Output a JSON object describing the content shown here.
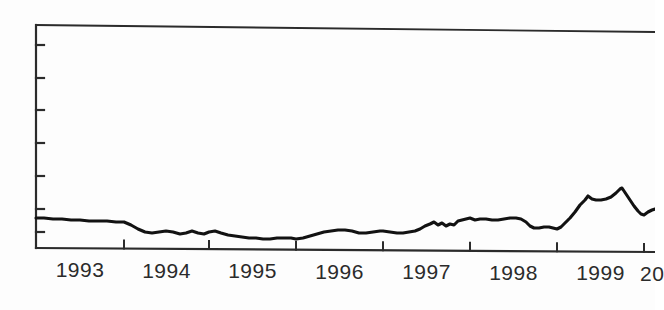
{
  "figure": {
    "kind": "scanned-line-chart",
    "background_color": "#fdfdfd",
    "ink_color": "#1f1f1f",
    "axis_color": "#2b2b2b",
    "line_color": "#121212"
  },
  "axes": {
    "x_axis_name": "year-axis",
    "y_axis_name": "value-axis",
    "y_axis_labels_visible": false,
    "x_axis_baseline_y": 248,
    "frame_left_x": 36,
    "frame_top_y_left": 25,
    "frame_top_y_right": 32,
    "y_tick_count": 7,
    "y_tick_positions_px": [
      45,
      78,
      110,
      143,
      176,
      209,
      232
    ],
    "x_tick_positions_px": [
      36,
      124,
      209,
      296,
      383,
      470,
      557,
      644
    ]
  },
  "chart_data": {
    "type": "line",
    "title": "",
    "subtitle": "",
    "xlabel": "",
    "ylabel": "",
    "grid": false,
    "legend": null,
    "annotations": [],
    "x_tick_labels": [
      "1993",
      "1994",
      "1995",
      "1996",
      "1997",
      "1998",
      "1999",
      "20"
    ],
    "x_tick_label_note": "final label clipped at right edge of image",
    "y_tick_labels": [],
    "xlim": [
      "1992.5",
      "2000.1"
    ],
    "series": [
      {
        "name": "series-1",
        "points": [
          [
            36,
            218
          ],
          [
            44,
            218
          ],
          [
            53,
            219
          ],
          [
            62,
            219
          ],
          [
            71,
            220
          ],
          [
            80,
            220
          ],
          [
            89,
            221
          ],
          [
            98,
            221
          ],
          [
            107,
            221
          ],
          [
            116,
            222
          ],
          [
            124,
            222
          ],
          [
            131,
            225
          ],
          [
            138,
            229
          ],
          [
            145,
            232
          ],
          [
            152,
            233
          ],
          [
            159,
            232
          ],
          [
            166,
            231
          ],
          [
            173,
            232
          ],
          [
            180,
            234
          ],
          [
            186,
            233
          ],
          [
            192,
            231
          ],
          [
            198,
            233
          ],
          [
            204,
            234
          ],
          [
            209,
            232
          ],
          [
            215,
            231
          ],
          [
            221,
            233
          ],
          [
            228,
            235
          ],
          [
            235,
            236
          ],
          [
            242,
            237
          ],
          [
            249,
            238
          ],
          [
            256,
            238
          ],
          [
            263,
            239
          ],
          [
            270,
            239
          ],
          [
            277,
            238
          ],
          [
            284,
            238
          ],
          [
            291,
            238
          ],
          [
            296,
            239
          ],
          [
            303,
            238
          ],
          [
            310,
            236
          ],
          [
            317,
            234
          ],
          [
            324,
            232
          ],
          [
            331,
            231
          ],
          [
            338,
            230
          ],
          [
            345,
            230
          ],
          [
            352,
            231
          ],
          [
            359,
            233
          ],
          [
            366,
            233
          ],
          [
            373,
            232
          ],
          [
            380,
            231
          ],
          [
            383,
            231
          ],
          [
            390,
            232
          ],
          [
            397,
            233
          ],
          [
            403,
            233
          ],
          [
            409,
            232
          ],
          [
            415,
            231
          ],
          [
            420,
            229
          ],
          [
            425,
            226
          ],
          [
            430,
            224
          ],
          [
            434,
            222
          ],
          [
            438,
            225
          ],
          [
            442,
            223
          ],
          [
            446,
            226
          ],
          [
            450,
            224
          ],
          [
            454,
            225
          ],
          [
            458,
            221
          ],
          [
            462,
            220
          ],
          [
            466,
            219
          ],
          [
            470,
            218
          ],
          [
            475,
            220
          ],
          [
            480,
            219
          ],
          [
            486,
            219
          ],
          [
            492,
            220
          ],
          [
            498,
            220
          ],
          [
            504,
            219
          ],
          [
            510,
            218
          ],
          [
            516,
            218
          ],
          [
            521,
            219
          ],
          [
            526,
            222
          ],
          [
            530,
            226
          ],
          [
            534,
            228
          ],
          [
            539,
            228
          ],
          [
            544,
            227
          ],
          [
            549,
            227
          ],
          [
            553,
            228
          ],
          [
            557,
            229
          ],
          [
            561,
            227
          ],
          [
            565,
            223
          ],
          [
            570,
            218
          ],
          [
            575,
            212
          ],
          [
            580,
            205
          ],
          [
            585,
            200
          ],
          [
            588,
            196
          ],
          [
            592,
            199
          ],
          [
            596,
            200
          ],
          [
            601,
            200
          ],
          [
            606,
            199
          ],
          [
            611,
            197
          ],
          [
            616,
            193
          ],
          [
            620,
            189
          ],
          [
            622,
            188
          ],
          [
            626,
            194
          ],
          [
            630,
            200
          ],
          [
            634,
            206
          ],
          [
            638,
            211
          ],
          [
            641,
            214
          ],
          [
            644,
            215
          ],
          [
            648,
            212
          ],
          [
            652,
            210
          ],
          [
            655,
            209
          ]
        ]
      }
    ]
  }
}
